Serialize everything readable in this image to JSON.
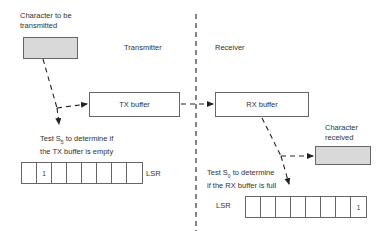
{
  "diagram": {
    "title_left": "Transmitter",
    "title_right": "Receiver",
    "source_label_line1": "Character to be",
    "source_label_line2": "transmitted",
    "tx_buffer_label": "TX buffer",
    "rx_buffer_label": "RX buffer",
    "dest_label_line1": "Character",
    "dest_label_line2": "received",
    "tx_test_line1_pre": "Test S",
    "tx_test_sub": "5",
    "tx_test_line1_post": " to determine if",
    "tx_test_line2": "the TX buffer is empty",
    "rx_test_line1_pre": "Test S",
    "rx_test_sub": "0",
    "rx_test_line1_post": " to determine",
    "rx_test_line2": "if the RX buffer is full",
    "tx_lsr_label": "LSR",
    "rx_lsr_label": "LSR",
    "tx_lsr_bits": [
      "",
      "1",
      "",
      "",
      "",
      "",
      "",
      ""
    ],
    "rx_lsr_bits": [
      "",
      "",
      "",
      "",
      "",
      "",
      "",
      "1"
    ],
    "colors": {
      "shaded": "#d9d9d9",
      "line": "#222222",
      "border": "#666666"
    }
  }
}
